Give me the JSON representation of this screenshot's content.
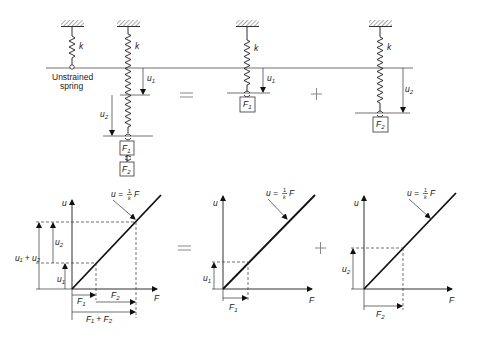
{
  "diagram": {
    "top_row": {
      "unstrained_label": [
        "Unstrained",
        "spring"
      ],
      "stiffness_label": "k",
      "displacement_labels": {
        "u1": "u",
        "u1_sub": "1",
        "u2": "u",
        "u2_sub": "2"
      },
      "force_labels": {
        "F1": "F",
        "F1_sub": "1",
        "F2": "F",
        "F2_sub": "2"
      },
      "operators": {
        "equals": "=",
        "plus": "+"
      }
    },
    "bottom_row": {
      "axis_u": "u",
      "axis_F": "F",
      "relation": {
        "lhs": "u =",
        "num": "1",
        "den": "k",
        "rhs": "F"
      },
      "labels": {
        "u1": "u",
        "u2": "u",
        "sum_u": "u₁ + u₂",
        "F1": "F",
        "F2": "F",
        "sum_F": "F₁ + F₂",
        "sub1": "1",
        "sub2": "2"
      },
      "operators": {
        "equals": "=",
        "plus": "+"
      }
    }
  }
}
